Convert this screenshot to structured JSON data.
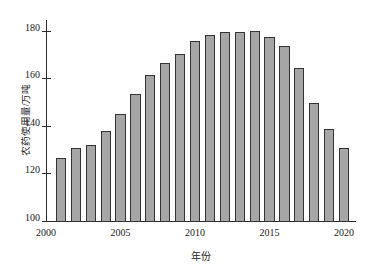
{
  "chart_data": {
    "type": "bar",
    "title": "",
    "xlabel": "年份",
    "ylabel": "农药使用量/万吨",
    "categories": [
      2001,
      2002,
      2003,
      2004,
      2005,
      2006,
      2007,
      2008,
      2009,
      2010,
      2011,
      2012,
      2013,
      2014,
      2015,
      2016,
      2017,
      2018,
      2019,
      2020
    ],
    "values": [
      127.0,
      131.0,
      132.5,
      138.5,
      145.5,
      154.0,
      162.0,
      167.0,
      170.5,
      176.0,
      178.5,
      180.0,
      180.0,
      180.5,
      178.0,
      174.0,
      165.0,
      150.0,
      139.0,
      131.0
    ],
    "ylim": [
      100,
      185
    ],
    "xlim": [
      2000,
      2020.8
    ],
    "yticks": [
      100,
      120,
      140,
      160,
      180
    ],
    "ytick_labels": [
      "100",
      "120",
      "140",
      "160",
      "180"
    ],
    "xticks": [
      2000,
      2005,
      2010,
      2015,
      2020
    ],
    "xtick_labels": [
      "2000",
      "2005",
      "2010",
      "2015",
      "2020"
    ],
    "grid": false,
    "legend": null,
    "bar_color": "#a6a6a6",
    "bar_edge_color": "#333333",
    "axis_color": "#2b2b2b",
    "background": "#ffffff"
  }
}
